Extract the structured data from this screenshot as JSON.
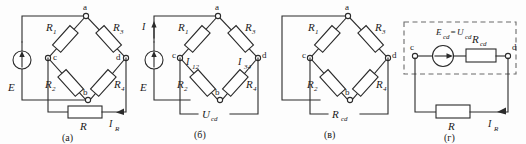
{
  "figure": {
    "background_color": "#fdfdfd",
    "line_color": "#2b2b2b",
    "dash_color": "#6b6b6b"
  },
  "panels": [
    {
      "id": "a",
      "caption": "(а)",
      "nodes": {
        "a": "a",
        "b": "b",
        "c": "c",
        "d": "d"
      },
      "resistors": {
        "r1": "R",
        "r1_sub": "1",
        "r3": "R",
        "r3_sub": "3",
        "r2": "R",
        "r2_sub": "2",
        "r4": "R",
        "r4_sub": "4",
        "load": "R"
      },
      "source_label": "E",
      "current_load": "I",
      "current_load_sub": "R"
    },
    {
      "id": "b",
      "caption": "(б)",
      "nodes": {
        "a": "a",
        "b": "b",
        "c": "c",
        "d": "d"
      },
      "resistors": {
        "r1": "R",
        "r1_sub": "1",
        "r3": "R",
        "r3_sub": "3",
        "r2": "R",
        "r2_sub": "2",
        "r4": "R",
        "r4_sub": "4"
      },
      "source_label": "E",
      "current_total": "I",
      "current_left": "I",
      "current_left_sub": "12",
      "current_right": "I",
      "current_right_sub": "34",
      "voltage_open": "U",
      "voltage_open_sub": "cd"
    },
    {
      "id": "v",
      "caption": "(в)",
      "nodes": {
        "a": "a",
        "b": "b",
        "c": "c",
        "d": "d"
      },
      "resistors": {
        "r1": "R",
        "r1_sub": "1",
        "r3": "R",
        "r3_sub": "3",
        "r2": "R",
        "r2_sub": "2",
        "r4": "R",
        "r4_sub": "4"
      },
      "resistance_equiv": "R",
      "resistance_equiv_sub": "cd"
    },
    {
      "id": "g",
      "caption": "(г)",
      "nodes": {
        "c": "c",
        "d": "d"
      },
      "emf_equation_left": "E",
      "emf_equation_left_sub": "cd",
      "emf_equation_mid": "=",
      "emf_equation_right": "U",
      "emf_equation_right_sub": "cd",
      "resistance_equiv": "R",
      "resistance_equiv_sub": "cd",
      "load": "R",
      "current_load": "I",
      "current_load_sub": "R"
    }
  ]
}
